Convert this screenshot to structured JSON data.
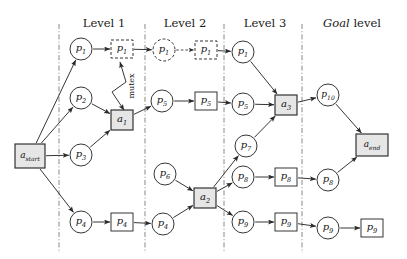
{
  "figure": {
    "type": "planning-graph-diagram",
    "background": "#ffffff",
    "colors": {
      "stroke": "#2b2b2b",
      "action_fill": "#e6e6e6",
      "separator": "#7a7a7a",
      "text": "#111111"
    }
  },
  "level_titles": [
    {
      "id": "level-1",
      "text": "Level 1",
      "italic_word": "",
      "x": 104,
      "y": 16
    },
    {
      "id": "level-2",
      "text": "Level 2",
      "italic_word": "",
      "x": 185,
      "y": 16
    },
    {
      "id": "level-3",
      "text": "Level 3",
      "italic_word": "",
      "x": 265,
      "y": 16
    },
    {
      "id": "goal-level",
      "text": " level",
      "italic_word": "Goal",
      "x": 352,
      "y": 16
    }
  ],
  "separators": [
    {
      "id": "sep-0",
      "x": 59
    },
    {
      "id": "sep-1",
      "x": 145
    },
    {
      "id": "sep-2",
      "x": 224
    },
    {
      "id": "sep-3",
      "x": 302
    }
  ],
  "nodes": [
    {
      "id": "a-start",
      "kind": "action",
      "shape": "rect",
      "label": "a",
      "sub": "start",
      "cx": 30,
      "cy": 156,
      "w": 30,
      "h": 24,
      "style": "solid"
    },
    {
      "id": "p1-l1",
      "kind": "proposition",
      "shape": "circle",
      "label": "p",
      "sub": "1",
      "cx": 81,
      "cy": 49,
      "r": 11,
      "style": "solid"
    },
    {
      "id": "p2-l1",
      "kind": "proposition",
      "shape": "circle",
      "label": "p",
      "sub": "2",
      "cx": 81,
      "cy": 98,
      "r": 11,
      "style": "solid"
    },
    {
      "id": "p3-l1",
      "kind": "proposition",
      "shape": "circle",
      "label": "p",
      "sub": "3",
      "cx": 81,
      "cy": 155,
      "r": 11,
      "style": "solid"
    },
    {
      "id": "p4-l1",
      "kind": "proposition",
      "shape": "circle",
      "label": "p",
      "sub": "4",
      "cx": 81,
      "cy": 222,
      "r": 11,
      "style": "solid"
    },
    {
      "id": "p1-box-l1",
      "kind": "noop",
      "shape": "rect",
      "label": "p",
      "sub": "1",
      "cx": 122,
      "cy": 49,
      "w": 22,
      "h": 18,
      "style": "dashed"
    },
    {
      "id": "a1",
      "kind": "action",
      "shape": "rect",
      "label": "a",
      "sub": "1",
      "cx": 122,
      "cy": 120,
      "w": 22,
      "h": 20,
      "style": "solid"
    },
    {
      "id": "p4-box-l1",
      "kind": "noop",
      "shape": "rect",
      "label": "p",
      "sub": "4",
      "cx": 122,
      "cy": 222,
      "w": 22,
      "h": 18,
      "style": "solid"
    },
    {
      "id": "p1-l2",
      "kind": "proposition",
      "shape": "circle",
      "label": "p",
      "sub": "1",
      "cx": 164,
      "cy": 50,
      "r": 11,
      "style": "dashed"
    },
    {
      "id": "p5-l2",
      "kind": "proposition",
      "shape": "circle",
      "label": "p",
      "sub": "5",
      "cx": 162,
      "cy": 101,
      "r": 11,
      "style": "solid"
    },
    {
      "id": "p6-l2",
      "kind": "proposition",
      "shape": "circle",
      "label": "p",
      "sub": "6",
      "cx": 165,
      "cy": 174,
      "r": 11,
      "style": "solid"
    },
    {
      "id": "p4-l2",
      "kind": "proposition",
      "shape": "circle",
      "label": "p",
      "sub": "4",
      "cx": 163,
      "cy": 224,
      "r": 11,
      "style": "solid"
    },
    {
      "id": "p1-box-l2",
      "kind": "noop",
      "shape": "rect",
      "label": "p",
      "sub": "1",
      "cx": 206,
      "cy": 50,
      "w": 22,
      "h": 18,
      "style": "dashed"
    },
    {
      "id": "p5-box-l2",
      "kind": "noop",
      "shape": "rect",
      "label": "p",
      "sub": "5",
      "cx": 206,
      "cy": 101,
      "w": 22,
      "h": 18,
      "style": "solid"
    },
    {
      "id": "a2",
      "kind": "action",
      "shape": "rect",
      "label": "a",
      "sub": "2",
      "cx": 205,
      "cy": 198,
      "w": 22,
      "h": 20,
      "style": "solid"
    },
    {
      "id": "p1-l3",
      "kind": "proposition",
      "shape": "circle",
      "label": "p",
      "sub": "1",
      "cx": 243,
      "cy": 52,
      "r": 11,
      "style": "solid"
    },
    {
      "id": "p5-l3",
      "kind": "proposition",
      "shape": "circle",
      "label": "p",
      "sub": "5",
      "cx": 243,
      "cy": 104,
      "r": 11,
      "style": "solid"
    },
    {
      "id": "p7-l3",
      "kind": "proposition",
      "shape": "circle",
      "label": "p",
      "sub": "7",
      "cx": 246,
      "cy": 146,
      "r": 11,
      "style": "solid"
    },
    {
      "id": "p8-l3",
      "kind": "proposition",
      "shape": "circle",
      "label": "p",
      "sub": "8",
      "cx": 243,
      "cy": 177,
      "r": 11,
      "style": "solid"
    },
    {
      "id": "p9-l3",
      "kind": "proposition",
      "shape": "circle",
      "label": "p",
      "sub": "9",
      "cx": 243,
      "cy": 222,
      "r": 11,
      "style": "solid"
    },
    {
      "id": "a3",
      "kind": "action",
      "shape": "rect",
      "label": "a",
      "sub": "3",
      "cx": 286,
      "cy": 105,
      "w": 22,
      "h": 20,
      "style": "solid"
    },
    {
      "id": "p8-box-l3",
      "kind": "noop",
      "shape": "rect",
      "label": "p",
      "sub": "8",
      "cx": 286,
      "cy": 177,
      "w": 22,
      "h": 18,
      "style": "solid"
    },
    {
      "id": "p9-box-l3",
      "kind": "noop",
      "shape": "rect",
      "label": "p",
      "sub": "9",
      "cx": 286,
      "cy": 222,
      "w": 22,
      "h": 18,
      "style": "solid"
    },
    {
      "id": "p10-goal",
      "kind": "proposition",
      "shape": "circle",
      "label": "p",
      "sub": "10",
      "cx": 328,
      "cy": 95,
      "r": 11,
      "style": "solid"
    },
    {
      "id": "p8-goal",
      "kind": "proposition",
      "shape": "circle",
      "label": "p",
      "sub": "8",
      "cx": 328,
      "cy": 180,
      "r": 11,
      "style": "solid"
    },
    {
      "id": "p9-goal",
      "kind": "proposition",
      "shape": "circle",
      "label": "p",
      "sub": "9",
      "cx": 328,
      "cy": 228,
      "r": 11,
      "style": "solid"
    },
    {
      "id": "a-end",
      "kind": "action",
      "shape": "rect",
      "label": "a",
      "sub": "end",
      "cx": 372,
      "cy": 145,
      "w": 32,
      "h": 22,
      "style": "solid"
    },
    {
      "id": "p9-box-goal",
      "kind": "noop",
      "shape": "rect",
      "label": "p",
      "sub": "9",
      "cx": 372,
      "cy": 228,
      "w": 22,
      "h": 18,
      "style": "solid"
    }
  ],
  "edges": [
    {
      "id": "e-start-p1",
      "from": "a-start",
      "to": "p1-l1",
      "style": "solid"
    },
    {
      "id": "e-start-p2",
      "from": "a-start",
      "to": "p2-l1",
      "style": "solid"
    },
    {
      "id": "e-start-p3",
      "from": "a-start",
      "to": "p3-l1",
      "style": "solid"
    },
    {
      "id": "e-start-p4",
      "from": "a-start",
      "to": "p4-l1",
      "style": "solid"
    },
    {
      "id": "e-p1-p1box",
      "from": "p1-l1",
      "to": "p1-box-l1",
      "style": "solid"
    },
    {
      "id": "e-p2-a1",
      "from": "p2-l1",
      "to": "a1",
      "style": "solid"
    },
    {
      "id": "e-p3-a1",
      "from": "p3-l1",
      "to": "a1",
      "style": "solid"
    },
    {
      "id": "e-p4-p4box",
      "from": "p4-l1",
      "to": "p4-box-l1",
      "style": "solid"
    },
    {
      "id": "e-p1box-p1l2",
      "from": "p1-box-l1",
      "to": "p1-l2",
      "style": "solid"
    },
    {
      "id": "e-a1-p5",
      "from": "a1",
      "to": "p5-l2",
      "style": "solid"
    },
    {
      "id": "e-p4box-p4l2",
      "from": "p4-box-l1",
      "to": "p4-l2",
      "style": "solid"
    },
    {
      "id": "e-p1l2-p1box2",
      "from": "p1-l2",
      "to": "p1-box-l2",
      "style": "dashed"
    },
    {
      "id": "e-p5l2-p5box2",
      "from": "p5-l2",
      "to": "p5-box-l2",
      "style": "solid"
    },
    {
      "id": "e-p6-a2",
      "from": "p6-l2",
      "to": "a2",
      "style": "solid"
    },
    {
      "id": "e-p4l2-a2",
      "from": "p4-l2",
      "to": "a2",
      "style": "solid"
    },
    {
      "id": "e-p1box2-p1l3",
      "from": "p1-box-l2",
      "to": "p1-l3",
      "style": "solid"
    },
    {
      "id": "e-p5box2-p5l3",
      "from": "p5-box-l2",
      "to": "p5-l3",
      "style": "solid"
    },
    {
      "id": "e-a2-p7",
      "from": "a2",
      "to": "p7-l3",
      "style": "solid"
    },
    {
      "id": "e-a2-p8",
      "from": "a2",
      "to": "p8-l3",
      "style": "solid"
    },
    {
      "id": "e-a2-p9",
      "from": "a2",
      "to": "p9-l3",
      "style": "solid"
    },
    {
      "id": "e-p1l3-a3",
      "from": "p1-l3",
      "to": "a3",
      "style": "solid"
    },
    {
      "id": "e-p5l3-a3",
      "from": "p5-l3",
      "to": "a3",
      "style": "solid"
    },
    {
      "id": "e-p7-a3",
      "from": "p7-l3",
      "to": "a3",
      "style": "solid"
    },
    {
      "id": "e-p8l3-p8box",
      "from": "p8-l3",
      "to": "p8-box-l3",
      "style": "solid"
    },
    {
      "id": "e-p9l3-p9box",
      "from": "p9-l3",
      "to": "p9-box-l3",
      "style": "solid"
    },
    {
      "id": "e-a3-p10",
      "from": "a3",
      "to": "p10-goal",
      "style": "solid"
    },
    {
      "id": "e-p8box-p8goal",
      "from": "p8-box-l3",
      "to": "p8-goal",
      "style": "solid"
    },
    {
      "id": "e-p9box-p9goal",
      "from": "p9-box-l3",
      "to": "p9-goal",
      "style": "solid"
    },
    {
      "id": "e-p10-aend",
      "from": "p10-goal",
      "to": "a-end",
      "style": "solid"
    },
    {
      "id": "e-p8goal-aend",
      "from": "p8-goal",
      "to": "a-end",
      "style": "solid"
    },
    {
      "id": "e-p9goal-p9box",
      "from": "p9-goal",
      "to": "p9-box-goal",
      "style": "solid"
    }
  ],
  "mutex": {
    "label": "mutex",
    "label_x": 131,
    "label_y": 86,
    "rotation": -90,
    "from": "a1",
    "to": "p1-box-l1"
  }
}
